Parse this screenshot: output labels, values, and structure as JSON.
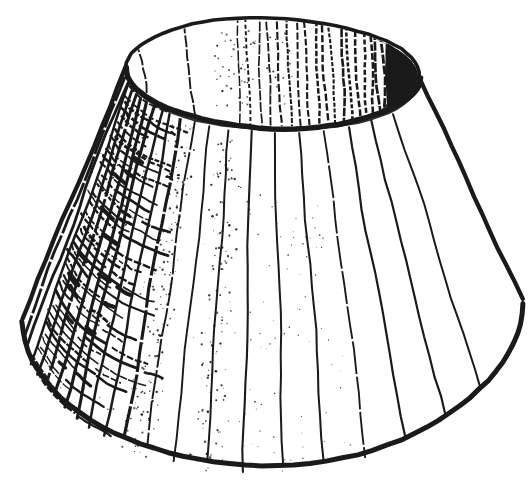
{
  "illustration": {
    "subject": "lampshade-sketch",
    "description": "Hand-drawn black ink sketch of a truncated-cone lampshade viewed from slightly above: elliptical top opening with dense vertical hatching darkening toward its right tip, vertical rib lines fanning down the flared body, heavy scribbled charcoal shading on the left side and speckled stipple texture beside it.",
    "background_color": "#ffffff",
    "ink_color": "#1a1a1a",
    "canvas": {
      "width": 532,
      "height": 480
    },
    "seed": 7,
    "top_opening": {
      "cx": 273,
      "cy": 73,
      "rx": 147,
      "ry": 55,
      "rotation_deg": 2,
      "back_rim_width": 3.6,
      "front_rim_width": 5.4
    },
    "base": {
      "cx": 272,
      "cy": 308,
      "rx": 250,
      "ry": 157,
      "rotation_deg": -2.2,
      "stroke_width": 5
    },
    "side_stroke_width": 4.3,
    "ribs": {
      "stroke_width": 2.1,
      "phis_deg": [
        174,
        169.5,
        165,
        160.5,
        156,
        151.5,
        147,
        142.5,
        138,
        133,
        127.5,
        121.5,
        114.5,
        106.5,
        98,
        89,
        79.5,
        69.5,
        59,
        47.5,
        35
      ]
    },
    "inner_hatch": {
      "count": 26,
      "x_start": 240,
      "x_end": 416,
      "tip_extra_strokes": 24,
      "dark_tip_x": 388
    },
    "inner_wall_lines_x": [
      150,
      196
    ],
    "inner_stipple_count": 60,
    "left_shading": {
      "phi_from_deg": 167,
      "phi_to_deg": 127,
      "rows": 44,
      "blotches": 18
    },
    "stipple": {
      "main_count": 300,
      "sparse_count": 80,
      "rim_pocket_count": 60
    }
  }
}
